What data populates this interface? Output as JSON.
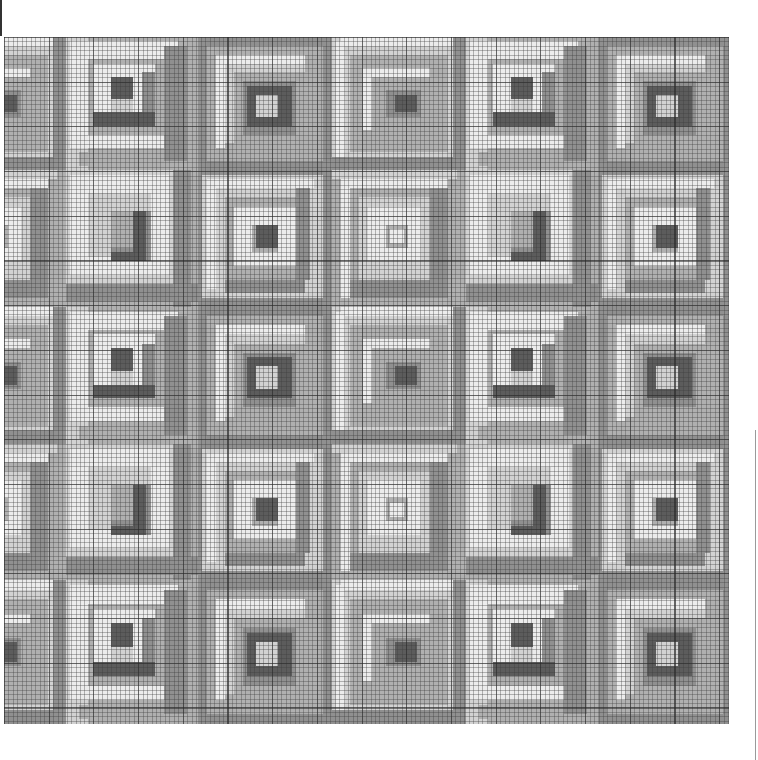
{
  "chart_data": {
    "type": "heatmap",
    "title": "",
    "grid": {
      "cell_px": 4.47,
      "cells_per_block": 30,
      "major_line_every": 10,
      "origin_px": [
        4,
        37
      ],
      "size_px": [
        725,
        687
      ]
    },
    "palette": {
      "white": "#ececec",
      "light": "#d2d2d2",
      "mid": "#b0b0b0",
      "midDark": "#909090",
      "dark": "#5c5c5c"
    },
    "columns_px": [
      -72,
      62,
      194,
      328,
      462,
      594
    ],
    "rows_px": [
      0,
      133,
      270,
      407,
      543
    ],
    "row_heights_px": [
      133,
      137,
      137,
      136,
      144
    ],
    "layout": [
      [
        "C1",
        "A1",
        "B1",
        "C1",
        "A1",
        "B1"
      ],
      [
        "C2",
        "A2",
        "B2",
        "C2",
        "A2",
        "B2"
      ],
      [
        "C1",
        "A1",
        "B1",
        "C1",
        "A1",
        "B1"
      ],
      [
        "C2",
        "A2",
        "B2",
        "C2",
        "A2",
        "B2"
      ],
      [
        "C1",
        "A1",
        "B1",
        "C1",
        "A1",
        "B1"
      ]
    ],
    "block_types": {
      "A1": [
        [
          "mid",
          0,
          0,
          30,
          30
        ],
        [
          "light",
          0,
          0,
          5,
          30
        ],
        [
          "white",
          1,
          1,
          24,
          24
        ],
        [
          "mid",
          3,
          26,
          27,
          3
        ],
        [
          "midDark",
          22,
          2,
          5,
          26
        ],
        [
          "mid",
          5,
          5,
          17,
          17
        ],
        [
          "white",
          6,
          6,
          14,
          14
        ],
        [
          "midDark",
          17,
          8,
          3,
          12
        ],
        [
          "dark",
          6,
          17,
          14,
          3
        ],
        [
          "white",
          8,
          8,
          8,
          8
        ],
        [
          "dark",
          10,
          9,
          5,
          5
        ],
        [
          "light",
          10,
          14,
          5,
          3
        ]
      ],
      "B1": [
        [
          "midDark",
          0,
          0,
          30,
          30
        ],
        [
          "mid",
          2,
          2,
          26,
          26
        ],
        [
          "white",
          4,
          4,
          20,
          2
        ],
        [
          "white",
          4,
          4,
          2,
          21
        ],
        [
          "light",
          6,
          6,
          18,
          18
        ],
        [
          "mid",
          8,
          8,
          16,
          16
        ],
        [
          "midDark",
          10,
          10,
          12,
          12
        ],
        [
          "dark",
          11,
          11,
          10,
          9
        ],
        [
          "light",
          13,
          13,
          5,
          5
        ]
      ],
      "C1": [
        [
          "light",
          0,
          0,
          30,
          30
        ],
        [
          "white",
          2,
          0,
          26,
          2
        ],
        [
          "midDark",
          27,
          0,
          3,
          30
        ],
        [
          "midDark",
          0,
          27,
          30,
          3
        ],
        [
          "white",
          1,
          1,
          2,
          26
        ],
        [
          "mid",
          4,
          4,
          22,
          22
        ],
        [
          "white",
          7,
          7,
          15,
          14
        ],
        [
          "mid",
          9,
          9,
          13,
          12
        ],
        [
          "midDark",
          12,
          12,
          8,
          6
        ],
        [
          "dark",
          14,
          13,
          5,
          4
        ]
      ],
      "A2": [
        [
          "mid",
          0,
          0,
          30,
          30
        ],
        [
          "light",
          0,
          0,
          26,
          26
        ],
        [
          "white",
          1,
          1,
          22,
          22
        ],
        [
          "light",
          5,
          5,
          14,
          14
        ],
        [
          "midDark",
          10,
          9,
          9,
          11
        ],
        [
          "mid",
          10,
          9,
          6,
          8
        ],
        [
          "dark",
          15,
          9,
          3,
          11
        ],
        [
          "dark",
          10,
          18,
          8,
          2
        ],
        [
          "midDark",
          24,
          0,
          4,
          30
        ],
        [
          "midDark",
          0,
          25,
          30,
          4
        ]
      ],
      "B2": [
        [
          "midDark",
          0,
          0,
          30,
          30
        ],
        [
          "light",
          1,
          1,
          27,
          27
        ],
        [
          "white",
          2,
          2,
          24,
          2
        ],
        [
          "white",
          2,
          2,
          2,
          24
        ],
        [
          "mid",
          6,
          6,
          18,
          18
        ],
        [
          "white",
          8,
          8,
          14,
          13
        ],
        [
          "mid",
          12,
          12,
          6,
          6
        ],
        [
          "dark",
          13,
          12,
          5,
          5
        ],
        [
          "midDark",
          22,
          4,
          3,
          20
        ],
        [
          "midDark",
          6,
          24,
          18,
          3
        ]
      ],
      "C2": [
        [
          "mid",
          0,
          0,
          30,
          30
        ],
        [
          "light",
          0,
          0,
          28,
          2
        ],
        [
          "white",
          2,
          2,
          24,
          2
        ],
        [
          "white",
          2,
          2,
          2,
          26
        ],
        [
          "light",
          6,
          6,
          18,
          18
        ],
        [
          "white",
          8,
          8,
          12,
          12
        ],
        [
          "mid",
          12,
          12,
          5,
          5
        ],
        [
          "white",
          13,
          13,
          3,
          3
        ],
        [
          "midDark",
          22,
          4,
          4,
          22
        ],
        [
          "midDark",
          4,
          24,
          22,
          4
        ]
      ]
    }
  },
  "page": {
    "margin_marks": [
      "left-rule",
      "right-rule"
    ]
  }
}
